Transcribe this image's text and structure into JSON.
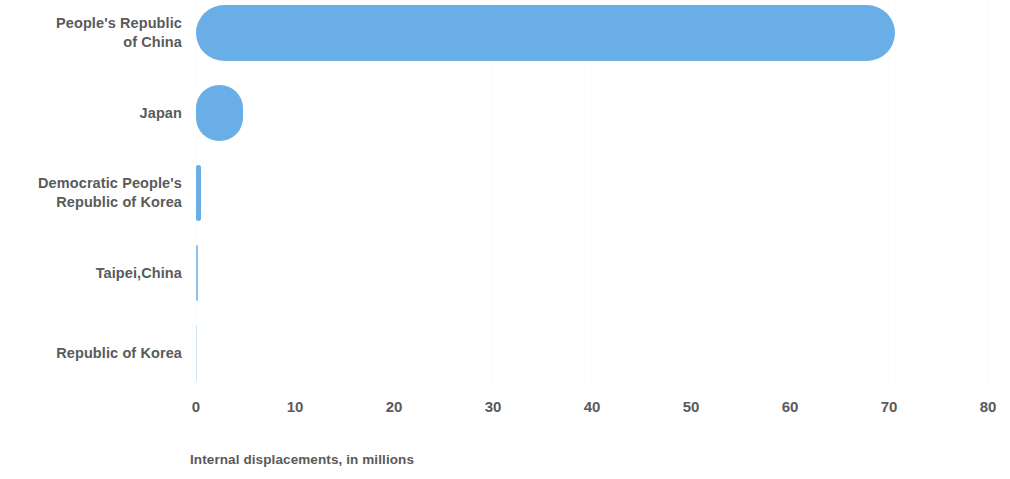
{
  "chart_data": {
    "type": "bar",
    "orientation": "horizontal",
    "title": "",
    "xlabel": "Internal displacements, in millions",
    "ylabel": "",
    "categories": [
      "People's Republic of China",
      "Japan",
      "Democratic People's Republic of Korea",
      "Taipei,China",
      "Republic of Korea"
    ],
    "values": [
      70.6,
      4.7,
      0.45,
      0.2,
      0.05
    ],
    "xlim": [
      0,
      80
    ],
    "xticks": [
      0,
      10,
      20,
      30,
      40,
      50,
      60,
      70,
      80
    ],
    "xtick_labels": [
      "0",
      "10",
      "20",
      "30",
      "40",
      "50",
      "60",
      "70",
      "80"
    ],
    "grid": true,
    "legend": "none",
    "bar_color": "#6aaee8",
    "label_color": "#5a5a5a",
    "background_color": "#ffffff"
  },
  "labels": {
    "cat0_line1": "People's Republic",
    "cat0_line2": "of China",
    "cat1_line1": "Japan",
    "cat2_line1": "Democratic People's",
    "cat2_line2": "Republic of Korea",
    "cat3_line1": "Taipei,China",
    "cat4_line1": "Republic of Korea"
  },
  "axis": {
    "title": "Internal displacements, in millions",
    "tick0": "0",
    "tick1": "10",
    "tick2": "20",
    "tick3": "30",
    "tick4": "40",
    "tick5": "50",
    "tick6": "60",
    "tick7": "70",
    "tick8": "80"
  }
}
